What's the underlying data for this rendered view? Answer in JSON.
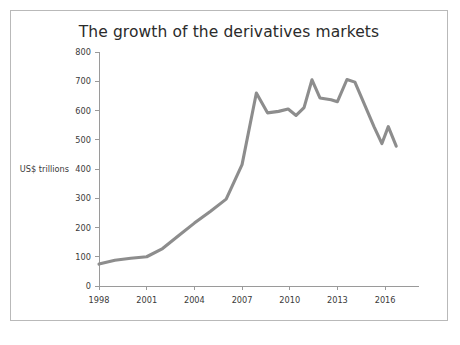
{
  "figure": {
    "border_color": "#b9b9b9",
    "background": "#ffffff"
  },
  "chart_data": {
    "type": "line",
    "title": "The growth of the derivatives markets",
    "xlabel": "",
    "ylabel": "US$ trillions",
    "ylabel_position_value": 400,
    "xlim": [
      1998,
      2017
    ],
    "ylim": [
      0,
      800
    ],
    "grid": false,
    "legend": false,
    "line_color": "#8d8d8d",
    "x_tick_labels": [
      "1998",
      "2001",
      "2004",
      "2007",
      "2010",
      "2013",
      "2016"
    ],
    "x_ticks": [
      1998,
      2001,
      2004,
      2007,
      2010,
      2013,
      2016
    ],
    "y_tick_labels": [
      "0",
      "100",
      "200",
      "300",
      "400",
      "500",
      "600",
      "700",
      "800"
    ],
    "y_ticks": [
      0,
      100,
      200,
      300,
      400,
      500,
      600,
      700,
      800
    ],
    "series": [
      {
        "name": "Notional amount outstanding",
        "x": [
          1998,
          1999,
          2000,
          2001,
          2002,
          2003,
          2004,
          2005,
          2006,
          2007,
          2008,
          2009,
          2010,
          2011,
          2012,
          2013,
          2014,
          2015,
          2016,
          2017
        ],
        "values": [
          75,
          88,
          95,
          100,
          128,
          172,
          215,
          255,
          297,
          415,
          660,
          592,
          603,
          583,
          705,
          640,
          633,
          706,
          490,
          480
        ]
      }
    ],
    "data_points": [
      {
        "x": 1998.0,
        "y": 75
      },
      {
        "x": 1999.0,
        "y": 88
      },
      {
        "x": 2000.0,
        "y": 95
      },
      {
        "x": 2001.0,
        "y": 100
      },
      {
        "x": 2002.0,
        "y": 128
      },
      {
        "x": 2003.0,
        "y": 172
      },
      {
        "x": 2004.0,
        "y": 215
      },
      {
        "x": 2005.0,
        "y": 255
      },
      {
        "x": 2006.0,
        "y": 297
      },
      {
        "x": 2007.0,
        "y": 415
      },
      {
        "x": 2007.9,
        "y": 660
      },
      {
        "x": 2008.6,
        "y": 592
      },
      {
        "x": 2009.3,
        "y": 597
      },
      {
        "x": 2009.9,
        "y": 605
      },
      {
        "x": 2010.4,
        "y": 583
      },
      {
        "x": 2010.9,
        "y": 610
      },
      {
        "x": 2011.4,
        "y": 705
      },
      {
        "x": 2011.9,
        "y": 643
      },
      {
        "x": 2012.6,
        "y": 637
      },
      {
        "x": 2013.0,
        "y": 630
      },
      {
        "x": 2013.6,
        "y": 706
      },
      {
        "x": 2014.1,
        "y": 697
      },
      {
        "x": 2015.3,
        "y": 545
      },
      {
        "x": 2015.8,
        "y": 487
      },
      {
        "x": 2016.2,
        "y": 545
      },
      {
        "x": 2016.7,
        "y": 478
      }
    ]
  }
}
